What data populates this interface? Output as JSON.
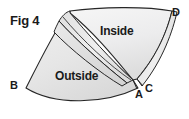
{
  "figure": {
    "caption": "Fig 4",
    "background_color": "#ffffff",
    "stroke_color": "#1a1a1a",
    "fill_light": "#f2f2f2",
    "fill_mid": "#e4e4e4",
    "fill_dark": "#d6d6d6",
    "width": 189,
    "height": 119
  },
  "regions": [
    {
      "id": "inside",
      "label": "Inside"
    },
    {
      "id": "outside",
      "label": "Outside"
    }
  ],
  "vertices": [
    {
      "id": "a",
      "label": "A"
    },
    {
      "id": "b",
      "label": "B"
    },
    {
      "id": "c",
      "label": "C"
    },
    {
      "id": "d",
      "label": "D"
    }
  ]
}
